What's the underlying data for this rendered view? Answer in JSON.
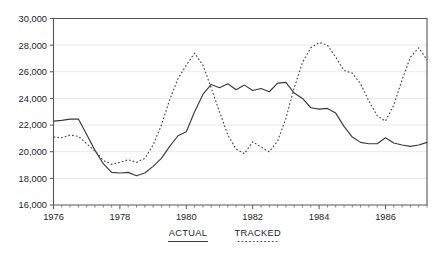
{
  "chart_data": {
    "type": "line",
    "title": "",
    "subtitle": "",
    "xlabel": "",
    "ylabel": "",
    "xlim": [
      1976.0,
      1987.25
    ],
    "ylim": [
      16000,
      30000
    ],
    "grid": true,
    "y_ticks": [
      16000,
      18000,
      20000,
      22000,
      24000,
      26000,
      28000,
      30000
    ],
    "y_tick_labels": [
      "16,000",
      "18,000",
      "20,000",
      "22,000",
      "24,000",
      "26,000",
      "28,000",
      "30,000"
    ],
    "x_ticks": [
      1976,
      1978,
      1980,
      1982,
      1984,
      1986
    ],
    "x_tick_labels": [
      "1976",
      "1978",
      "1980",
      "1982",
      "1984",
      "1986"
    ],
    "x_minor_interval": 0.25,
    "legend_position": "below-axis",
    "x": [
      1976.0,
      1976.25,
      1976.5,
      1976.75,
      1977.0,
      1977.25,
      1977.5,
      1977.75,
      1978.0,
      1978.25,
      1978.5,
      1978.75,
      1979.0,
      1979.25,
      1979.5,
      1979.75,
      1980.0,
      1980.25,
      1980.5,
      1980.75,
      1981.0,
      1981.25,
      1981.5,
      1981.75,
      1982.0,
      1982.25,
      1982.5,
      1982.75,
      1983.0,
      1983.25,
      1983.5,
      1983.75,
      1984.0,
      1984.25,
      1984.5,
      1984.75,
      1985.0,
      1985.25,
      1985.5,
      1985.75,
      1986.0,
      1986.25,
      1986.5,
      1986.75,
      1987.0,
      1987.25
    ],
    "series": [
      {
        "name": "ACTUAL",
        "style": "solid",
        "color": "#3a3a3d",
        "values": [
          22300,
          22350,
          22450,
          22450,
          21300,
          20100,
          19100,
          18450,
          18400,
          18450,
          18200,
          18400,
          18900,
          19500,
          20400,
          21200,
          21500,
          23000,
          24300,
          25050,
          24800,
          25100,
          24650,
          25000,
          24600,
          24750,
          24500,
          25150,
          25200,
          24400,
          24000,
          23300,
          23200,
          23250,
          22900,
          21900,
          21100,
          20700,
          20600,
          20600,
          21050,
          20650,
          20500,
          20400,
          20500,
          20700
        ]
      },
      {
        "name": "TRACKED",
        "style": "dotted",
        "color": "#4a4a4d",
        "values": [
          21100,
          21050,
          21250,
          21150,
          20600,
          20050,
          19350,
          19050,
          19200,
          19400,
          19200,
          19500,
          20500,
          22000,
          23900,
          25500,
          26500,
          27400,
          26500,
          24800,
          23000,
          21250,
          20200,
          19850,
          20750,
          20350,
          20000,
          20800,
          22500,
          24800,
          26700,
          27800,
          28200,
          28000,
          27100,
          26100,
          25900,
          25100,
          23800,
          22700,
          22300,
          23500,
          25400,
          27100,
          27800,
          26900
        ]
      }
    ],
    "legend": [
      {
        "label": "ACTUAL",
        "style": "solid"
      },
      {
        "label": "TRACKED",
        "style": "dotted"
      }
    ]
  }
}
